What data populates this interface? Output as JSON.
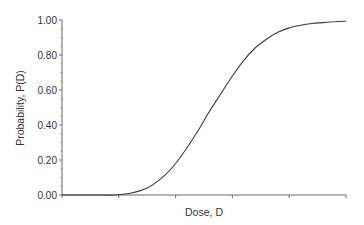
{
  "chart_data": {
    "type": "line",
    "title": "",
    "xlabel": "Dose, D",
    "ylabel": "Probability, P(D)",
    "ylim": [
      0.0,
      1.0
    ],
    "xlim": [
      0,
      5
    ],
    "yticks": [
      "0.00",
      "0.20",
      "0.40",
      "0.60",
      "0.80",
      "1.00"
    ],
    "xticks": [],
    "x_tick_count": 5,
    "y_minor_ticks": true,
    "grid": false,
    "legend": null,
    "series": [
      {
        "name": "P(D)",
        "color": "#3a3a3a",
        "x": [
          0.0,
          0.5,
          0.93,
          1.2,
          1.5,
          1.8,
          2.0,
          2.2,
          2.4,
          2.6,
          2.8,
          3.0,
          3.2,
          3.4,
          3.6,
          3.8,
          4.0,
          4.2,
          4.4,
          4.6,
          4.8,
          5.0
        ],
        "values": [
          0.0,
          0.0,
          0.0,
          0.01,
          0.04,
          0.11,
          0.18,
          0.27,
          0.37,
          0.48,
          0.58,
          0.68,
          0.77,
          0.84,
          0.89,
          0.93,
          0.955,
          0.97,
          0.98,
          0.985,
          0.99,
          0.993
        ]
      }
    ]
  },
  "axes": {
    "y_labels": [
      "1.00",
      "0.80",
      "0.60",
      "0.40",
      "0.20",
      "0.00"
    ],
    "x_title": "Dose, D",
    "y_title": "Probability, P(D)"
  }
}
